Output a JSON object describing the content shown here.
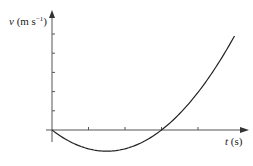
{
  "chart_data": {
    "type": "line",
    "title": "",
    "xlabel": "t (s)",
    "ylabel": "v (m s⁻¹)",
    "xlabel_italic": "t",
    "xlabel_unit": " (s)",
    "ylabel_italic": "v",
    "ylabel_unit": " (m s",
    "ylabel_sup": "−1",
    "ylabel_close": ")",
    "x_ticks": [
      1,
      2,
      3,
      4
    ],
    "y_ticks": [
      1,
      2,
      3,
      4,
      5
    ],
    "tick_labels_shown": false,
    "grid": false,
    "legend": null,
    "xlim": [
      0,
      5.5
    ],
    "ylim": [
      -1.2,
      6.1
    ],
    "series": [
      {
        "name": "velocity",
        "description": "parabola through origin, minimum near t=1.5, crosses zero at t=3",
        "x": [
          0,
          0.5,
          1,
          1.5,
          2,
          2.5,
          3,
          3.5,
          4,
          4.5,
          5
        ],
        "y": [
          0,
          -0.61,
          -0.98,
          -1.1,
          -0.98,
          -0.61,
          0,
          0.86,
          1.96,
          3.31,
          4.9
        ]
      }
    ],
    "color": "#222222"
  }
}
